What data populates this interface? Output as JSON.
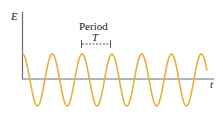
{
  "diagram": {
    "y_axis_label": "E",
    "x_axis_label": "t",
    "annotation_title": "Period",
    "annotation_symbol": "T",
    "colors": {
      "wave": "#E8AE3A",
      "axis": "#6b6b78",
      "bracket": "#444444"
    },
    "wave": {
      "type": "cosine",
      "cycles_shown": 6.2,
      "period_px": 29.8,
      "amplitude_px": 26
    }
  }
}
